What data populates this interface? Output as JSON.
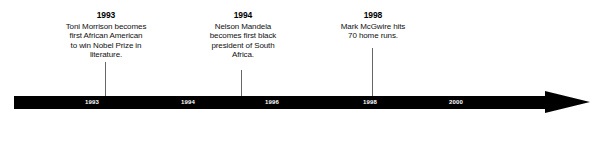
{
  "figure": {
    "type": "timeline",
    "background_color": "#ffffff",
    "bar_color": "#000000",
    "tick_label_color": "#ffffff",
    "text_color": "#111111"
  },
  "axis": {
    "ticks": [
      {
        "label": "1993",
        "x": 92
      },
      {
        "label": "1994",
        "x": 188
      },
      {
        "label": "1996",
        "x": 272
      },
      {
        "label": "1998",
        "x": 370
      },
      {
        "label": "2000",
        "x": 456
      }
    ]
  },
  "events": [
    {
      "year": "1993",
      "description": "Toni Morrison becomes\nfirst African American\nto win Nobel Prize in\nliterature."
    },
    {
      "year": "1994",
      "description": "Nelson Mandela\nbecomes first black\npresident of South\nAfrica."
    },
    {
      "year": "1998",
      "description": "Mark McGwire hits\n70 home runs."
    }
  ]
}
